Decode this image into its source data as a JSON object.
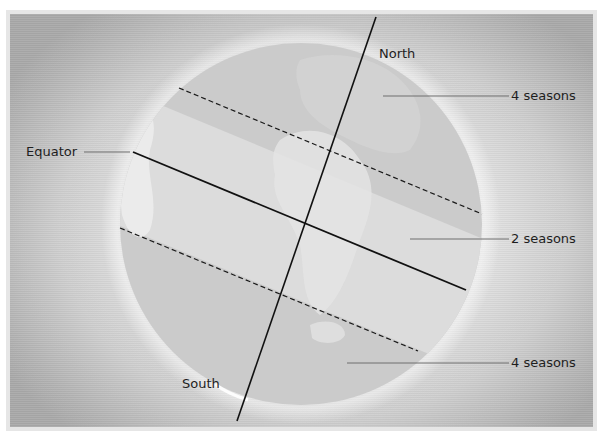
{
  "diagram": {
    "title": "",
    "labels": {
      "north": "North",
      "south": "South",
      "equator": "Equator",
      "zone_north": "4 seasons",
      "zone_tropics": "2 seasons",
      "zone_south": "4 seasons"
    },
    "colors": {
      "background_center": "#f4f4f4",
      "background_edge": "#a9a9a9",
      "globe_polar_zone": "#cbcbcb",
      "globe_tropical_zone": "#dedede",
      "land_highlight": "#ececec",
      "axis_line": "#111111",
      "leader_line": "#6e6e6e",
      "text": "#1e1e1e"
    },
    "elements": {
      "axis": {
        "from": [
          376,
          17
        ],
        "to": [
          237,
          421
        ],
        "style": "solid"
      },
      "equator": {
        "from": [
          133,
          152
        ],
        "to": [
          466,
          290
        ],
        "style": "solid"
      },
      "tropic_north": {
        "from": [
          179,
          88
        ],
        "to": [
          482,
          214
        ],
        "style": "dashed"
      },
      "tropic_south": {
        "from": [
          120,
          228
        ],
        "to": [
          418,
          351
        ],
        "style": "dashed"
      },
      "globe": {
        "cx": 301,
        "cy": 224,
        "r": 181
      }
    }
  }
}
